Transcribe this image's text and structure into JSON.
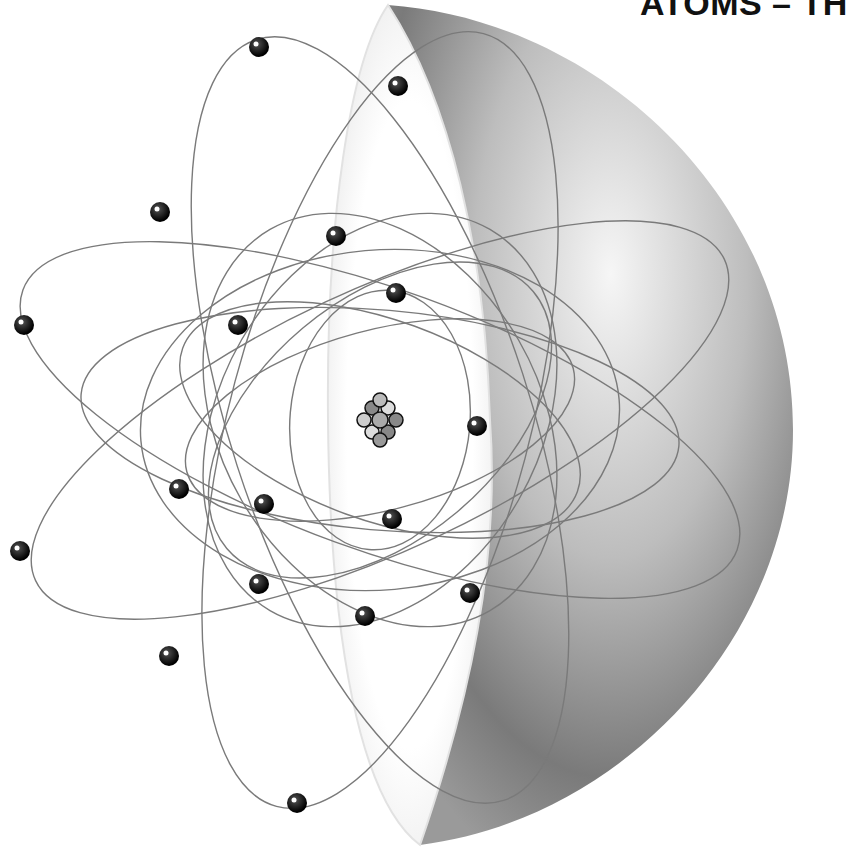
{
  "header": {
    "title": "ATOMS – TH"
  },
  "illustration": {
    "subject": "atom-model-cutaway-sphere",
    "nucleus": {
      "x": 380,
      "y": 420
    },
    "electrons": [
      {
        "x": 259,
        "y": 47
      },
      {
        "x": 398,
        "y": 86
      },
      {
        "x": 160,
        "y": 212
      },
      {
        "x": 336,
        "y": 236
      },
      {
        "x": 24,
        "y": 325
      },
      {
        "x": 238,
        "y": 325
      },
      {
        "x": 396,
        "y": 293
      },
      {
        "x": 477,
        "y": 426
      },
      {
        "x": 179,
        "y": 489
      },
      {
        "x": 264,
        "y": 504
      },
      {
        "x": 392,
        "y": 519
      },
      {
        "x": 20,
        "y": 551
      },
      {
        "x": 259,
        "y": 584
      },
      {
        "x": 470,
        "y": 593
      },
      {
        "x": 365,
        "y": 616
      },
      {
        "x": 169,
        "y": 656
      },
      {
        "x": 297,
        "y": 803
      }
    ],
    "colors": {
      "orbit": "#7a7a7a",
      "electron": "#0a0a0a",
      "sphere_light": "#f4f4f4",
      "sphere_dark": "#6e6e6e"
    }
  }
}
